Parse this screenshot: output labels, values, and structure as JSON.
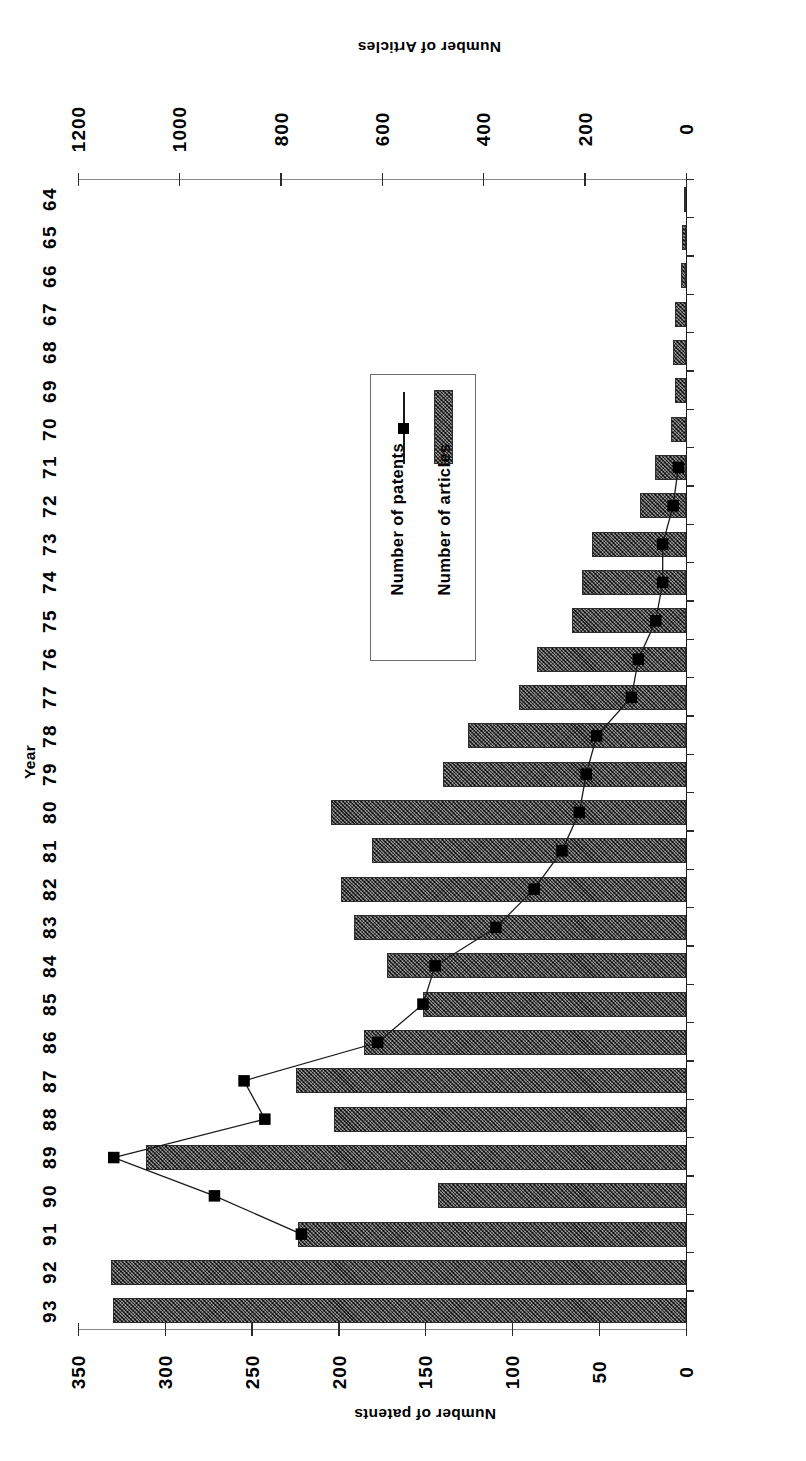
{
  "figure": {
    "orientation_note": "scanned-upside-down",
    "background": "#ffffff",
    "ink": "#000000",
    "bar_fill": "#4a4a4a",
    "marker_color": "#000000"
  },
  "axes": {
    "category_title": "Year",
    "primary_value_title": "Number of Articles",
    "secondary_value_title": "Number of patents",
    "primary_ticks": [
      "0",
      "200",
      "400",
      "600",
      "800",
      "1000",
      "1200"
    ],
    "secondary_ticks": [
      "0",
      "50",
      "100",
      "150",
      "200",
      "250",
      "300",
      "350"
    ]
  },
  "legend": {
    "items": [
      {
        "label": "Number of articles",
        "glyph": "hatched-bar-swatch"
      },
      {
        "label": "Number of patents",
        "glyph": "line-with-square-marker"
      }
    ]
  },
  "chart_data": {
    "type": "bar",
    "title": "",
    "subtitle": "",
    "xlabel": "Year",
    "ylabel": "Number of Articles",
    "y2label": "Number of patents",
    "grid": false,
    "legend_position": "inside-left",
    "orientation": "horizontal",
    "ylim": [
      0,
      1200
    ],
    "y2lim": [
      0,
      350
    ],
    "categories": [
      "64",
      "65",
      "66",
      "67",
      "68",
      "69",
      "70",
      "71",
      "72",
      "73",
      "74",
      "75",
      "76",
      "77",
      "78",
      "79",
      "80",
      "81",
      "82",
      "83",
      "84",
      "85",
      "86",
      "87",
      "88",
      "89",
      "90",
      "91",
      "92",
      "93"
    ],
    "series": [
      {
        "name": "Number of articles",
        "type": "bar",
        "axis": "primary",
        "unit": "articles",
        "values": [
          3,
          8,
          10,
          22,
          25,
          22,
          30,
          62,
          90,
          185,
          205,
          225,
          295,
          330,
          430,
          480,
          700,
          620,
          680,
          655,
          590,
          520,
          635,
          770,
          695,
          1065,
          490,
          765,
          1135,
          1130
        ]
      },
      {
        "name": "Number of patents",
        "type": "line",
        "axis": "secondary",
        "unit": "patents",
        "marker": "square",
        "values": [
          null,
          null,
          null,
          null,
          null,
          null,
          null,
          5,
          8,
          14,
          14,
          18,
          28,
          32,
          52,
          58,
          62,
          72,
          88,
          110,
          145,
          152,
          178,
          255,
          243,
          330,
          272,
          222,
          null,
          null
        ]
      }
    ]
  }
}
